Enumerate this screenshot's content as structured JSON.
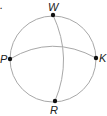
{
  "diagram": {
    "points": [
      {
        "id": "W",
        "label": "W",
        "position": "top"
      },
      {
        "id": "P",
        "label": "P",
        "position": "left"
      },
      {
        "id": "K",
        "label": "K",
        "position": "right"
      },
      {
        "id": "R",
        "label": "R",
        "position": "bottom"
      }
    ],
    "arcs": [
      {
        "from": "P",
        "to": "K"
      },
      {
        "from": "W",
        "to": "R"
      }
    ],
    "stray_mark": "."
  }
}
